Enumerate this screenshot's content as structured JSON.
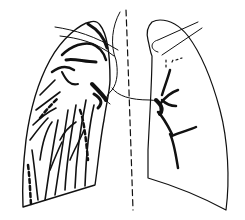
{
  "figure": {
    "colors": {
      "ink": "#111111",
      "background": "#ffffff"
    }
  }
}
